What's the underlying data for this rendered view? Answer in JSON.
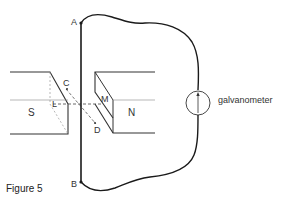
{
  "figure": {
    "caption": "Figure 5",
    "labels": {
      "A": "A",
      "B": "B",
      "C": "C",
      "D": "D",
      "L": "L",
      "M": "M",
      "S": "S",
      "N": "N"
    },
    "galvanometer_label": "galvanometer"
  },
  "colors": {
    "wire": "#1a1a1a",
    "magnet_edge": "#333333",
    "dashed": "#555555",
    "background": "#ffffff"
  }
}
